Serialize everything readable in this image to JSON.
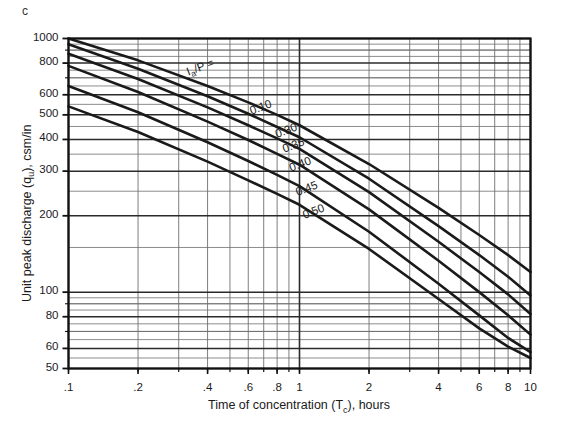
{
  "panel": {
    "letter": "c"
  },
  "axes": {
    "xlabel_plain": "Time of concentration (Tc), hours",
    "ylabel_plain": "Unit peak discharge (qu), csm/in",
    "xlabel_main": "Time of concentration (T",
    "xlabel_sub": "c",
    "xlabel_tail": "), hours",
    "ylabel_main": "Unit peak discharge (q",
    "ylabel_sub": "u",
    "ylabel_tail": "), csm/in"
  },
  "chart_data": {
    "type": "line",
    "title": "",
    "subtitle": "",
    "xlabel": "Time of concentration (Tc), hours",
    "ylabel": "Unit peak discharge (qu), csm/in",
    "xscale": "log",
    "yscale": "log",
    "xlim": [
      0.1,
      10
    ],
    "ylim": [
      50,
      1000
    ],
    "grid": true,
    "grid_minor": true,
    "legend_position": "inline-curve-labels",
    "xticks": [
      0.1,
      0.2,
      0.4,
      0.6,
      0.8,
      1,
      2,
      4,
      6,
      8,
      10
    ],
    "xtick_labels": [
      ".1",
      ".2",
      ".4",
      ".6",
      ".8",
      "1",
      "2",
      "4",
      "6",
      "8",
      "10"
    ],
    "yticks": [
      50,
      60,
      80,
      100,
      200,
      300,
      400,
      500,
      600,
      800,
      1000
    ],
    "ytick_labels": [
      "50",
      "60",
      "80",
      "100",
      "200",
      "300",
      "400",
      "500",
      "600",
      "800",
      "1000"
    ],
    "series_label_prefix": "Ia/P =",
    "series": [
      {
        "name": "0.10",
        "label": "0.10",
        "x": [
          0.1,
          0.2,
          0.4,
          0.6,
          0.8,
          1,
          2,
          4,
          6,
          8,
          10
        ],
        "values": [
          1000,
          820,
          650,
          560,
          500,
          455,
          320,
          215,
          168,
          140,
          120
        ]
      },
      {
        "name": "0.30",
        "label": "0.30",
        "x": [
          0.1,
          0.2,
          0.4,
          0.6,
          0.8,
          1,
          2,
          4,
          6,
          8,
          10
        ],
        "values": [
          950,
          760,
          592,
          505,
          448,
          408,
          280,
          182,
          140,
          115,
          97
        ]
      },
      {
        "name": "0.35",
        "label": "0.35",
        "x": [
          0.1,
          0.2,
          0.4,
          0.6,
          0.8,
          1,
          2,
          4,
          6,
          8,
          10
        ],
        "values": [
          870,
          692,
          535,
          455,
          404,
          367,
          248,
          158,
          120,
          98,
          82
        ]
      },
      {
        "name": "0.40",
        "label": "0.40",
        "x": [
          0.1,
          0.2,
          0.4,
          0.6,
          0.8,
          1,
          2,
          4,
          6,
          8,
          10
        ],
        "values": [
          780,
          615,
          470,
          398,
          351,
          318,
          212,
          133,
          100,
          81,
          68
        ]
      },
      {
        "name": "0.45",
        "label": "0.45",
        "x": [
          0.1,
          0.2,
          0.4,
          0.6,
          0.8,
          1,
          2,
          4,
          6,
          8,
          10
        ],
        "values": [
          650,
          512,
          390,
          329,
          290,
          262,
          173,
          108,
          81,
          66,
          58
        ]
      },
      {
        "name": "0.50",
        "label": "0.50",
        "x": [
          0.1,
          0.2,
          0.4,
          0.6,
          0.8,
          1,
          2,
          4,
          6,
          8,
          10
        ],
        "values": [
          540,
          428,
          327,
          276,
          244,
          221,
          148,
          94,
          72,
          61,
          55
        ]
      }
    ],
    "annotations": [
      {
        "text": "Ia/P =",
        "note": "curve family label with subscript a"
      },
      {
        "text": "0.10"
      },
      {
        "text": "0.30"
      },
      {
        "text": "0.35"
      },
      {
        "text": "0.40"
      },
      {
        "text": "0.45"
      },
      {
        "text": "0.50"
      }
    ]
  },
  "style": {
    "curve_color": "#1a1a1a",
    "grid_major_color": "#2b2b2b",
    "grid_minor_color": "#6f6f6f",
    "axis_color": "#111111",
    "background": "#ffffff"
  }
}
